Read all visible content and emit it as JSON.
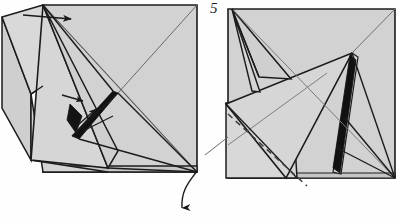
{
  "figure": {
    "kind": "origami-folding-diagram",
    "background_color": "#fefefe",
    "paper_fill": "#d2d2d2",
    "paper_fill_light": "#dcdcdc",
    "paper_fill_shaded": "#c6c6c6",
    "outline_color": "#1c1c1c",
    "thin_line_color": "#555555",
    "black_fold_color": "#111111",
    "arrow_color": "#1a1a1a",
    "dashed_line_color": "#4a4a4a"
  },
  "panels": [
    {
      "id": "panel-left",
      "name": "left-folding-step",
      "step_label": "",
      "description": "Model with left flap raised, thick black fold edge in the middle and two small pointer arrows",
      "bounds": {
        "x": 0,
        "y": 5,
        "width": 200,
        "height": 175
      }
    },
    {
      "id": "panel-right",
      "name": "right-folding-step",
      "step_label": "5",
      "description": "Resulting model after the fold, showing a black spine wedge and a dashed valley-fold guide line",
      "bounds": {
        "x": 225,
        "y": 8,
        "width": 172,
        "height": 172
      }
    }
  ],
  "annotations": {
    "step_number": "5",
    "arrows": [
      {
        "name": "top-insert-arrow",
        "type": "straight",
        "direction": "right",
        "from": [
          23,
          15
        ],
        "to": [
          73,
          19
        ]
      },
      {
        "name": "middle-pointer-arrow-upper",
        "type": "straight",
        "direction": "right",
        "from": [
          62,
          95
        ],
        "to": [
          84,
          101
        ]
      },
      {
        "name": "middle-pointer-arrow-lower",
        "type": "straight",
        "direction": "up-right",
        "from": [
          78,
          125
        ],
        "to": [
          97,
          108
        ]
      },
      {
        "name": "turn-over-curved-arrow",
        "type": "curved",
        "direction": "down",
        "from": [
          197,
          171
        ],
        "to": [
          182,
          216
        ]
      }
    ],
    "fold_lines": [
      {
        "name": "valley-fold-dashed-line",
        "style": "dashed",
        "from": [
          228,
          114
        ],
        "to": [
          307,
          186
        ]
      }
    ]
  }
}
